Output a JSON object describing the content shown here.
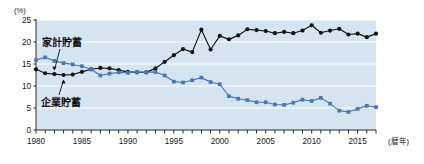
{
  "chart_data": {
    "type": "line",
    "title": "",
    "subtitle": "",
    "xlabel": "(暦年)",
    "ylabel": "(%)",
    "xlim": [
      1980,
      2017
    ],
    "ylim": [
      0,
      25
    ],
    "y_ticks": [
      0,
      5,
      10,
      15,
      20,
      25
    ],
    "y_tick_labels": [
      "0",
      "5",
      "10",
      "15",
      "20",
      "25"
    ],
    "x_ticks": [
      1980,
      1985,
      1990,
      1995,
      2000,
      2005,
      2010,
      2015
    ],
    "x_tick_labels": [
      "1980",
      "1985",
      "1990",
      "1995",
      "2000",
      "2005",
      "2010",
      "2015"
    ],
    "x_minor_tick_step": 1,
    "grid": true,
    "grid_axis": "y",
    "grid_color": "#ffffff",
    "plot_background": "#d5e5f0",
    "legend_position": "inline-annotation",
    "x": [
      1980,
      1981,
      1982,
      1983,
      1984,
      1985,
      1986,
      1987,
      1988,
      1989,
      1990,
      1991,
      1992,
      1993,
      1994,
      1995,
      1996,
      1997,
      1998,
      1999,
      2000,
      2001,
      2002,
      2003,
      2004,
      2005,
      2006,
      2007,
      2008,
      2009,
      2010,
      2011,
      2012,
      2013,
      2014,
      2015,
      2016,
      2017
    ],
    "series": [
      {
        "name": "家計貯蓄",
        "color": "#141414",
        "marker": "circle",
        "values": [
          13.8,
          12.9,
          12.7,
          12.5,
          12.6,
          13.2,
          13.8,
          14.1,
          14.0,
          13.6,
          13.2,
          13.1,
          13.1,
          14.0,
          15.5,
          17.0,
          18.4,
          17.7,
          22.8,
          18.3,
          21.4,
          20.6,
          21.5,
          22.9,
          22.7,
          22.5,
          22.0,
          22.3,
          22.0,
          22.6,
          23.8,
          22.1,
          22.6,
          23.0,
          21.7,
          21.9,
          21.1,
          21.9
        ]
      },
      {
        "name": "企業貯蓄",
        "color": "#4778b4",
        "marker": "square",
        "values": [
          15.9,
          16.5,
          15.7,
          15.2,
          14.9,
          14.5,
          13.8,
          12.4,
          12.8,
          13.1,
          13.0,
          13.2,
          13.1,
          13.2,
          12.4,
          11.0,
          10.8,
          11.3,
          11.9,
          10.9,
          10.4,
          7.7,
          7.1,
          6.8,
          6.3,
          6.3,
          5.8,
          5.7,
          6.2,
          6.9,
          6.6,
          7.3,
          6.0,
          4.4,
          4.1,
          4.8,
          5.5,
          5.2
        ]
      }
    ],
    "annotations": [
      {
        "text": "家計貯蓄",
        "target_year": 1982,
        "target_value": 12.7,
        "label_x": 42,
        "label_y": 46
      },
      {
        "text": "企業貯蓄",
        "target_year": 1983,
        "target_value": 12.5,
        "label_x": 41,
        "label_y": 106
      }
    ]
  },
  "layout": {
    "plot_left": 36,
    "plot_right": 376,
    "plot_top": 20,
    "plot_bottom": 130
  }
}
